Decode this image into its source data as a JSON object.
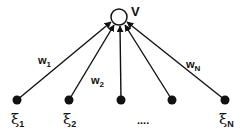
{
  "diagram": {
    "type": "single-layer perceptron",
    "output_node": {
      "label": "V",
      "cx": 119,
      "cy": 17,
      "r": 8
    },
    "input_nodes": [
      {
        "cx": 17,
        "cy": 100,
        "label": "ξ",
        "sub": "1"
      },
      {
        "cx": 69,
        "cy": 100,
        "label": "ξ",
        "sub": "2"
      },
      {
        "cx": 121,
        "cy": 100,
        "label": "",
        "sub": ""
      },
      {
        "cx": 172,
        "cy": 100,
        "label": "",
        "sub": ""
      },
      {
        "cx": 225,
        "cy": 100,
        "label": "ξ",
        "sub": "N"
      }
    ],
    "weights": [
      {
        "label": "w",
        "sub": "1"
      },
      {
        "label": "w",
        "sub": "2"
      },
      {
        "label": "w",
        "sub": "N"
      }
    ],
    "ellipsis": "....",
    "colors": {
      "stroke": "#111111",
      "node_fill": "#111111",
      "output_fill": "#ffffff"
    }
  }
}
